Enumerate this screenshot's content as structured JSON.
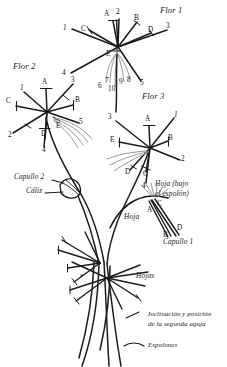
{
  "figure": {
    "kind": "botanical-line-diagram",
    "language": "es",
    "background_color": "#ffffff",
    "ink_color": "#1b1b1b",
    "spur_color": "#9a9a9a",
    "width": 227,
    "height": 367
  },
  "titles": {
    "flor1": "Flor 1",
    "flor2": "Flor 2",
    "flor3": "Flor 3"
  },
  "callouts": {
    "capullo2": "Capullo 2",
    "caliz": "Cáliz",
    "hoja_bajo_espolon_line1": "Hoja (bajo",
    "hoja_bajo_espolon_line2": "el espolón)",
    "hoja": "Hoja",
    "capullo1": "Capullo 1",
    "hojas": "Hojas"
  },
  "legend": {
    "items": [
      {
        "symbol": "short-slanted-stroke",
        "line1": "Inclinación y posición",
        "line2": "de la segunda aguja"
      },
      {
        "symbol": "shallow-arc-stroke",
        "line1": "Espolones",
        "line2": ""
      }
    ]
  },
  "flor1": {
    "letters": [
      "A",
      "B",
      "C",
      "D",
      "E"
    ],
    "numbers": [
      "1",
      "2",
      "3",
      "4",
      "5",
      "6",
      "7",
      "8",
      "9",
      "10"
    ]
  },
  "flor2": {
    "letters": [
      "A",
      "B",
      "C",
      "D",
      "E"
    ],
    "numbers": [
      "1",
      "2",
      "3",
      "4",
      "5"
    ]
  },
  "flor3": {
    "letters": [
      "A",
      "B",
      "C",
      "D",
      "E"
    ],
    "numbers": [
      "1",
      "2",
      "3",
      "4"
    ]
  },
  "capullo1_labels": {
    "letters": [
      "A",
      "B",
      "C",
      "D"
    ]
  },
  "marks": {
    "x_mark": "x"
  }
}
